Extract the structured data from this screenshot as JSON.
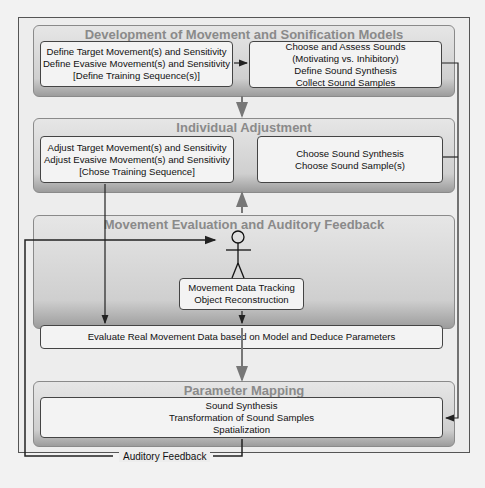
{
  "groups": {
    "development": {
      "title": "Development of Movement and Sonification Models",
      "left_box": [
        "Define Target Movement(s) and Sensitivity",
        "Define Evasive Movement(s) and Sensitivity",
        "[Define Training Sequence(s)]"
      ],
      "right_box": [
        "Choose and Assess Sounds",
        "(Motivating vs. Inhibitory)",
        "Define Sound Synthesis",
        "Collect Sound Samples"
      ]
    },
    "adjustment": {
      "title": "Individual Adjustment",
      "left_box": [
        "Adjust Target Movement(s) and Sensitivity",
        "Adjust Evasive Movement(s) and Sensitivity",
        "[Chose Training Sequence]"
      ],
      "right_box": [
        "Choose Sound Synthesis",
        "Choose Sound Sample(s)"
      ]
    },
    "evaluation": {
      "title": "Movement Evaluation and Auditory Feedback",
      "tracking_box": [
        "Movement Data Tracking",
        "Object Reconstruction"
      ],
      "evaluate_box": "Evaluate Real Movement Data based on Model and Deduce Parameters"
    },
    "mapping": {
      "title": "Parameter Mapping",
      "box": [
        "Sound Synthesis",
        "Transformation of Sound Samples",
        "Spatialization"
      ]
    }
  },
  "feedback_label": "Auditory Feedback",
  "icons": {
    "person": "stick-figure-icon"
  }
}
